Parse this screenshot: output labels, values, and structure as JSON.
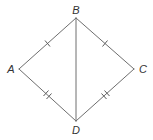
{
  "figure": {
    "type": "kite / quadrilateral with diagonal",
    "vertices": [
      {
        "id": "B",
        "label": "B",
        "x": 76,
        "y": 18,
        "label_x": 76,
        "label_y": 14
      },
      {
        "id": "A",
        "label": "A",
        "x": 19,
        "y": 69,
        "label_x": 11,
        "label_y": 73
      },
      {
        "id": "C",
        "label": "C",
        "x": 134,
        "y": 69,
        "label_x": 143,
        "label_y": 73
      },
      {
        "id": "D",
        "label": "D",
        "x": 76,
        "y": 121,
        "label_x": 76,
        "label_y": 134
      }
    ],
    "segments": [
      {
        "name": "AB",
        "from": "A",
        "to": "B",
        "tick_marks": 1
      },
      {
        "name": "BC",
        "from": "B",
        "to": "C",
        "tick_marks": 1
      },
      {
        "name": "AD",
        "from": "A",
        "to": "D",
        "tick_marks": 2
      },
      {
        "name": "CD",
        "from": "C",
        "to": "D",
        "tick_marks": 2
      },
      {
        "name": "BD",
        "from": "B",
        "to": "D",
        "tick_marks": 0
      }
    ],
    "congruences": [
      "AB ≅ BC",
      "AD ≅ CD"
    ],
    "colors": {
      "line": "#6e6e6e",
      "text": "#333333",
      "background": "#ffffff"
    }
  },
  "labels": {
    "A": "A",
    "B": "B",
    "C": "C",
    "D": "D"
  }
}
